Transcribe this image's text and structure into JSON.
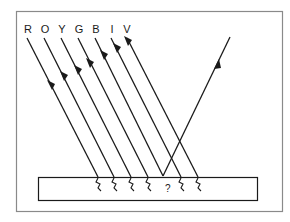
{
  "diagram": {
    "type": "light-absorption-reflection",
    "colors": {
      "ink": "#1a1a1a",
      "frame": "#8a8a8a",
      "background": "#ffffff"
    },
    "spectrum_labels": [
      "R",
      "O",
      "Y",
      "G",
      "B",
      "I",
      "V"
    ],
    "label_positions_x": [
      28,
      45,
      62,
      79,
      96,
      112,
      127
    ],
    "reflected_color": "B",
    "unknown_marker": "?",
    "surface": {
      "label": "",
      "x": 38,
      "y": 177,
      "width": 220,
      "height": 24
    },
    "frame": {
      "x": 16,
      "y": 11,
      "width": 267,
      "height": 201
    }
  }
}
